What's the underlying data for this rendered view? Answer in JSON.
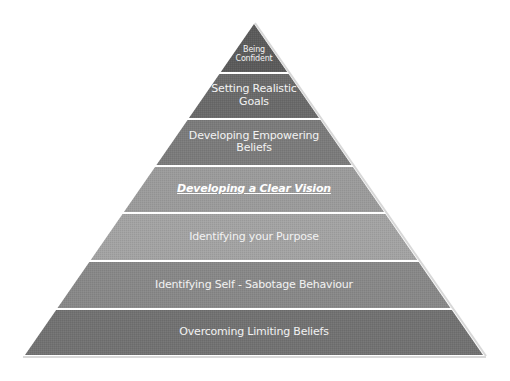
{
  "diagram": {
    "type": "pyramid",
    "apex": {
      "x": 254,
      "y": 24
    },
    "base": {
      "y": 355,
      "left_x": 25,
      "right_x": 483
    },
    "separator_color": "#ffffff",
    "edge_highlight_color": "#d8d8d8",
    "layers": [
      {
        "label": "Being\nConfident",
        "line1": "Being",
        "line2": "Confident",
        "top": 24,
        "bottom": 72,
        "fill": "#5b5b5b",
        "font_size": 8,
        "emphasis": false
      },
      {
        "label": "Setting Realistic Goals",
        "line1": "Setting Realistic",
        "line2": "Goals",
        "top": 74,
        "bottom": 118,
        "fill": "#6a6a6a",
        "font_size": 11,
        "emphasis": false
      },
      {
        "label": "Developing Empowering Beliefs",
        "line1": "Developing Empowering",
        "line2": "Beliefs",
        "top": 120,
        "bottom": 165,
        "fill": "#7b7b7b",
        "font_size": 11,
        "emphasis": false
      },
      {
        "label": "Developing a Clear Vision",
        "line1": "Developing a Clear Vision",
        "line2": "",
        "top": 167,
        "bottom": 212,
        "fill": "#9b9b9b",
        "font_size": 11,
        "emphasis": true
      },
      {
        "label": "Identifying your Purpose",
        "line1": "Identifying your Purpose",
        "line2": "",
        "top": 214,
        "bottom": 260,
        "fill": "#a3a3a3",
        "font_size": 11,
        "emphasis": false
      },
      {
        "label": "Identifying Self - Sabotage Behaviour",
        "line1": "Identifying Self - Sabotage Behaviour",
        "line2": "",
        "top": 262,
        "bottom": 308,
        "fill": "#888888",
        "font_size": 11,
        "emphasis": false
      },
      {
        "label": "Overcoming Limiting Beliefs",
        "line1": "Overcoming Limiting Beliefs",
        "line2": "",
        "top": 310,
        "bottom": 355,
        "fill": "#727272",
        "font_size": 11,
        "emphasis": false
      }
    ]
  }
}
